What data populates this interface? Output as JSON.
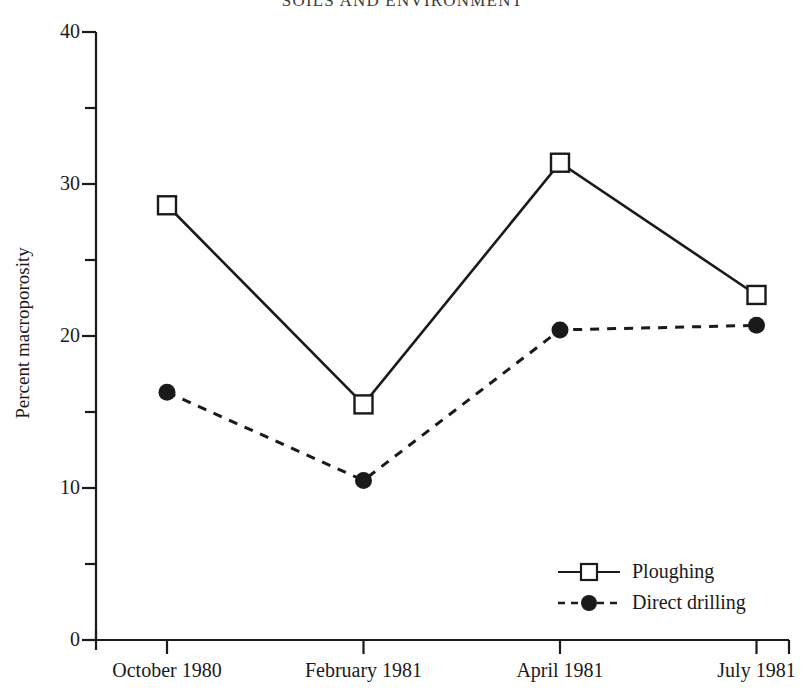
{
  "running_head": "SOILS AND ENVIRONMENT",
  "axis": {
    "y_label": "Percent macroporosity",
    "y_ticks": [
      "0",
      "10",
      "20",
      "30",
      "40"
    ],
    "x_ticks": [
      "October 1980",
      "February 1981",
      "April 1981",
      "July 1981"
    ]
  },
  "legend": {
    "items": [
      {
        "label": "Ploughing",
        "marker": "open-square",
        "line": "solid"
      },
      {
        "label": "Direct drilling",
        "marker": "filled-circle",
        "line": "dashed"
      }
    ]
  },
  "colors": {
    "ink": "#1a1a1a",
    "paper": "#ffffff"
  },
  "chart_data": {
    "type": "line",
    "title": "",
    "xlabel": "",
    "ylabel": "Percent macroporosity",
    "categories": [
      "October 1980",
      "February 1981",
      "April 1981",
      "July 1981"
    ],
    "ylim": [
      0,
      40
    ],
    "ytick_values": [
      0,
      10,
      20,
      30,
      40
    ],
    "yminor_tick_values": [
      5,
      15,
      25,
      35
    ],
    "grid": false,
    "legend_position": "bottom-right",
    "series": [
      {
        "name": "Ploughing",
        "marker": "open-square",
        "linestyle": "solid",
        "values": [
          28.6,
          15.5,
          31.4,
          22.7
        ]
      },
      {
        "name": "Direct drilling",
        "marker": "filled-circle",
        "linestyle": "dashed",
        "values": [
          16.3,
          10.5,
          20.4,
          20.7
        ]
      }
    ]
  }
}
